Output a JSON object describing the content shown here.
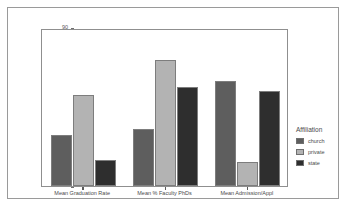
{
  "chart_data": {
    "type": "bar",
    "title": "",
    "xlabel": "",
    "ylabel": "",
    "ylim": [
      50,
      90
    ],
    "yticks": [
      "90",
      "80",
      "70",
      "60",
      "50"
    ],
    "ytick_values": [
      90,
      80,
      70,
      60,
      50
    ],
    "grid": false,
    "legend_position": "right",
    "legend_title": "Affiliation",
    "categories": [
      "Mean Graduation Rate",
      "Mean % Faculty PhDs",
      "Mean Admission/Appl"
    ],
    "series": [
      {
        "name": "church",
        "color": "#5e5e5e",
        "values": [
          63.0,
          64.5,
          76.5
        ]
      },
      {
        "name": "private",
        "color": "#b3b3b3",
        "values": [
          73.0,
          82.0,
          56.0
        ]
      },
      {
        "name": "state",
        "color": "#2e2e2e",
        "values": [
          56.5,
          75.0,
          74.0
        ]
      }
    ]
  },
  "colors": {
    "church": "#5e5e5e",
    "private": "#b3b3b3",
    "state": "#2e2e2e",
    "axis": "#8f8f8f",
    "frame": "#9a9a9a",
    "text": "#4a4a4a",
    "background": "#ffffff"
  }
}
